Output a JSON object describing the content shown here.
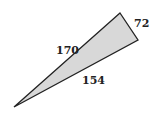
{
  "diagram": {
    "type": "triangle",
    "fill_color": "#d8d8d8",
    "stroke_color": "#222222",
    "vertices": {
      "top": [
        120,
        13
      ],
      "right": [
        138,
        40
      ],
      "bottom_left": [
        14,
        107
      ]
    },
    "sides": [
      {
        "label": "72",
        "between": [
          "top",
          "right"
        ]
      },
      {
        "label": "170",
        "between": [
          "bottom_left",
          "top"
        ]
      },
      {
        "label": "154",
        "between": [
          "bottom_left",
          "right"
        ]
      }
    ]
  }
}
